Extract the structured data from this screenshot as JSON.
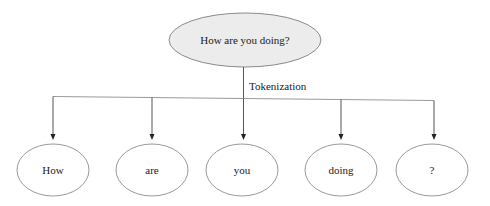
{
  "diagram": {
    "root": {
      "label": "How are you doing?"
    },
    "edge_label": "Tokenization",
    "tokens": [
      {
        "label": "How"
      },
      {
        "label": "are"
      },
      {
        "label": "you"
      },
      {
        "label": "doing"
      },
      {
        "label": "?"
      }
    ],
    "colors": {
      "background": "#ffffff",
      "root_fill": "#ececec",
      "token_fill": "#ffffff",
      "node_border": "#8a8a8a",
      "rail_line": "#9a9a9a",
      "branch_line": "#555555",
      "arrow": "#222222",
      "text": "#1a1a1a"
    }
  }
}
